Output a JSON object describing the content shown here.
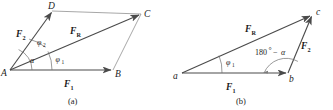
{
  "figure": {
    "background_color": "#ffffff",
    "line_color": "#4a4a4a",
    "thin_line_color": "#8a8a8a",
    "text_color": "#1b1b1b"
  },
  "panel_a": {
    "caption": "(a)",
    "type": "parallelogram",
    "vertices": [
      {
        "name": "A",
        "label": "A",
        "x": 10,
        "y": 70
      },
      {
        "name": "B",
        "label": "B",
        "x": 113,
        "y": 70
      },
      {
        "name": "C",
        "label": "C",
        "x": 141,
        "y": 14
      },
      {
        "name": "D",
        "label": "D",
        "x": 52,
        "y": 11
      }
    ],
    "vectors": [
      {
        "name": "F1",
        "label": "F",
        "subscript": "1",
        "from": "A",
        "to": "B"
      },
      {
        "name": "F2",
        "label": "F",
        "subscript": "2",
        "from": "A",
        "to": "D"
      },
      {
        "name": "FR",
        "label": "F",
        "subscript": "R",
        "from": "A",
        "to": "C"
      }
    ],
    "angles": [
      {
        "name": "alpha",
        "label": "α",
        "subscript": "",
        "between": "F1 and F2"
      },
      {
        "name": "phi1",
        "label": "φ",
        "subscript": "1",
        "between": "F1 and FR"
      },
      {
        "name": "phi2",
        "label": "φ",
        "subscript": "2",
        "between": "FR and F2"
      }
    ]
  },
  "panel_b": {
    "caption": "(b)",
    "type": "triangle",
    "vertices": [
      {
        "name": "a",
        "label": "a",
        "x": 182,
        "y": 73
      },
      {
        "name": "b",
        "label": "b",
        "x": 288,
        "y": 73
      },
      {
        "name": "c",
        "label": "c",
        "x": 313,
        "y": 14
      }
    ],
    "vectors": [
      {
        "name": "F1",
        "label": "F",
        "subscript": "1",
        "from": "a",
        "to": "b"
      },
      {
        "name": "F2",
        "label": "F",
        "subscript": "2",
        "from": "b",
        "to": "c"
      },
      {
        "name": "FR",
        "label": "F",
        "subscript": "R",
        "from": "a",
        "to": "c"
      }
    ],
    "angles": [
      {
        "name": "phi1",
        "label": "φ",
        "subscript": "1",
        "between": "F1 and FR"
      },
      {
        "name": "exterior",
        "label_prefix": "180",
        "degree": "°",
        "minus": "−",
        "label_suffix": "α",
        "full": "180° − α",
        "at": "b"
      }
    ]
  }
}
